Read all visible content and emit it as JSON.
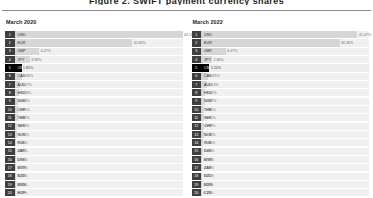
{
  "top_title": "Figure 2. SWIFT payment currency shares",
  "panels": [
    {
      "title": "March 2020",
      "rows": [
        {
          "rank": "1",
          "code": "USD",
          "value": "44.10%",
          "pct": 44.1,
          "highlight": false
        },
        {
          "rank": "2",
          "code": "EUR",
          "value": "30.84%",
          "pct": 30.84,
          "highlight": false
        },
        {
          "rank": "3",
          "code": "GBP",
          "value": "6.47%",
          "pct": 6.47,
          "highlight": false
        },
        {
          "rank": "4",
          "code": "JPY",
          "value": "3.98%",
          "pct": 3.98,
          "highlight": false
        },
        {
          "rank": "5",
          "code": "CNY",
          "value": "1.85%",
          "pct": 1.85,
          "highlight": true
        },
        {
          "rank": "6",
          "code": "CAD",
          "value": "1.84%",
          "pct": 1.84,
          "highlight": false
        },
        {
          "rank": "7",
          "code": "AUD",
          "value": "1.47%",
          "pct": 1.47,
          "highlight": false
        },
        {
          "rank": "8",
          "code": "HKD",
          "value": "1.28%",
          "pct": 1.28,
          "highlight": false
        },
        {
          "rank": "9",
          "code": "SGD",
          "value": "0.94%",
          "pct": 0.94,
          "highlight": false
        },
        {
          "rank": "10",
          "code": "CHF",
          "value": "0.91%",
          "pct": 0.91,
          "highlight": false
        },
        {
          "rank": "11",
          "code": "THB",
          "value": "0.91%",
          "pct": 0.91,
          "highlight": false
        },
        {
          "rank": "12",
          "code": "SEK",
          "value": "0.76%",
          "pct": 0.76,
          "highlight": false
        },
        {
          "rank": "13",
          "code": "NOK",
          "value": "0.70%",
          "pct": 0.7,
          "highlight": false
        },
        {
          "rank": "14",
          "code": "PLN",
          "value": "0.41%",
          "pct": 0.41,
          "highlight": false
        },
        {
          "rank": "15",
          "code": "ZAR",
          "value": "0.39%",
          "pct": 0.39,
          "highlight": false
        },
        {
          "rank": "16",
          "code": "DKK",
          "value": "0.39%",
          "pct": 0.39,
          "highlight": false
        },
        {
          "rank": "17",
          "code": "MYR",
          "value": "0.37%",
          "pct": 0.37,
          "highlight": false
        },
        {
          "rank": "18",
          "code": "NZD",
          "value": "0.33%",
          "pct": 0.33,
          "highlight": false
        },
        {
          "rank": "19",
          "code": "MXN",
          "value": "0.30%",
          "pct": 0.3,
          "highlight": false
        },
        {
          "rank": "20",
          "code": "HUF",
          "value": "0.23%",
          "pct": 0.23,
          "highlight": false
        }
      ]
    },
    {
      "title": "March 2022",
      "rows": [
        {
          "rank": "1",
          "code": "USD",
          "value": "41.07%",
          "pct": 41.07,
          "highlight": false
        },
        {
          "rank": "2",
          "code": "EUR",
          "value": "36.36%",
          "pct": 36.36,
          "highlight": false
        },
        {
          "rank": "3",
          "code": "GBP",
          "value": "6.47%",
          "pct": 6.47,
          "highlight": false
        },
        {
          "rank": "4",
          "code": "JPY",
          "value": "2.86%",
          "pct": 2.86,
          "highlight": false
        },
        {
          "rank": "5",
          "code": "CNY",
          "value": "2.20%",
          "pct": 2.2,
          "highlight": true
        },
        {
          "rank": "6",
          "code": "CAD",
          "value": "1.85%",
          "pct": 1.85,
          "highlight": false
        },
        {
          "rank": "7",
          "code": "AUD",
          "value": "1.53%",
          "pct": 1.53,
          "highlight": false
        },
        {
          "rank": "8",
          "code": "HKD",
          "value": "1.11%",
          "pct": 1.11,
          "highlight": false
        },
        {
          "rank": "9",
          "code": "SGD",
          "value": "0.97%",
          "pct": 0.97,
          "highlight": false
        },
        {
          "rank": "10",
          "code": "THB",
          "value": "0.81%",
          "pct": 0.81,
          "highlight": false
        },
        {
          "rank": "11",
          "code": "SEK",
          "value": "0.81%",
          "pct": 0.81,
          "highlight": false
        },
        {
          "rank": "12",
          "code": "CHF",
          "value": "0.72%",
          "pct": 0.72,
          "highlight": false
        },
        {
          "rank": "13",
          "code": "NOK",
          "value": "0.71%",
          "pct": 0.71,
          "highlight": false
        },
        {
          "rank": "14",
          "code": "PLN",
          "value": "0.65%",
          "pct": 0.65,
          "highlight": false
        },
        {
          "rank": "15",
          "code": "DKK",
          "value": "0.47%",
          "pct": 0.47,
          "highlight": false
        },
        {
          "rank": "16",
          "code": "MYR",
          "value": "0.36%",
          "pct": 0.36,
          "highlight": false
        },
        {
          "rank": "17",
          "code": "ZAR",
          "value": "0.34%",
          "pct": 0.34,
          "highlight": false
        },
        {
          "rank": "18",
          "code": "NZD",
          "value": "0.31%",
          "pct": 0.31,
          "highlight": false
        },
        {
          "rank": "19",
          "code": "MXN",
          "value": "0.23%",
          "pct": 0.23,
          "highlight": false
        },
        {
          "rank": "20",
          "code": "CZK",
          "value": "0.19%",
          "pct": 0.19,
          "highlight": false
        }
      ]
    }
  ],
  "chart_data": {
    "type": "bar",
    "title": "Figure 2. SWIFT payment currency shares",
    "orientation": "horizontal",
    "xlabel": "",
    "ylabel": "",
    "xlim": [
      0,
      44.1
    ],
    "grid": false,
    "legend": "none",
    "value_format": "percent",
    "highlight_category": "CNY",
    "highlight_color": "#000000",
    "bar_color": "#d6d6d6",
    "track_color": "#f0f0f0",
    "badge_color": "#3f3f3f",
    "panels": [
      {
        "title": "March 2020",
        "categories": [
          "USD",
          "EUR",
          "GBP",
          "JPY",
          "CNY",
          "CAD",
          "AUD",
          "HKD",
          "SGD",
          "CHF",
          "THB",
          "SEK",
          "NOK",
          "PLN",
          "ZAR",
          "DKK",
          "MYR",
          "NZD",
          "MXN",
          "HUF"
        ],
        "values": [
          44.1,
          30.84,
          6.47,
          3.98,
          1.85,
          1.84,
          1.47,
          1.28,
          0.94,
          0.91,
          0.91,
          0.76,
          0.7,
          0.41,
          0.39,
          0.39,
          0.37,
          0.33,
          0.3,
          0.23
        ]
      },
      {
        "title": "March 2022",
        "categories": [
          "USD",
          "EUR",
          "GBP",
          "JPY",
          "CNY",
          "CAD",
          "AUD",
          "HKD",
          "SGD",
          "THB",
          "SEK",
          "CHF",
          "NOK",
          "PLN",
          "DKK",
          "MYR",
          "ZAR",
          "NZD",
          "MXN",
          "CZK"
        ],
        "values": [
          41.07,
          36.36,
          6.47,
          2.86,
          2.2,
          1.85,
          1.53,
          1.11,
          0.97,
          0.81,
          0.81,
          0.72,
          0.71,
          0.65,
          0.47,
          0.36,
          0.34,
          0.31,
          0.23,
          0.19
        ]
      }
    ]
  }
}
